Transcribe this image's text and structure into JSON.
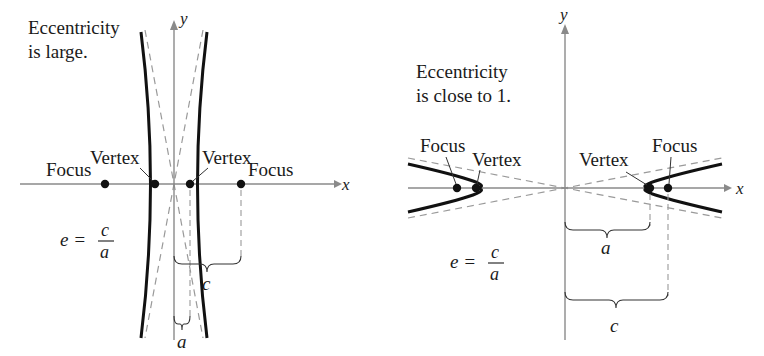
{
  "figure": {
    "panels": [
      {
        "id": "large-eccentricity",
        "caption_line1": "Eccentricity",
        "caption_line2": "is large.",
        "axis_x_label": "x",
        "axis_y_label": "y",
        "focus_left_label": "Focus",
        "focus_right_label": "Focus",
        "vertex_left_label": "Vertex",
        "vertex_right_label": "Vertex",
        "formula_lhs": "e =",
        "formula_num": "c",
        "formula_den": "a",
        "brace_c_label": "c",
        "brace_a_label": "a"
      },
      {
        "id": "eccentricity-close-to-1",
        "caption_line1": "Eccentricity",
        "caption_line2": "is close to 1.",
        "axis_x_label": "x",
        "axis_y_label": "y",
        "focus_left_label": "Focus",
        "focus_right_label": "Focus",
        "vertex_left_label": "Vertex",
        "vertex_right_label": "Vertex",
        "formula_lhs": "e =",
        "formula_num": "c",
        "formula_den": "a",
        "brace_a_label": "a",
        "brace_c_label": "c"
      }
    ],
    "colors": {
      "curve": "#111111",
      "axis": "#8a8a8a",
      "dashed": "#9a9a9a",
      "text": "#1a1a1a",
      "background": "#ffffff"
    }
  }
}
